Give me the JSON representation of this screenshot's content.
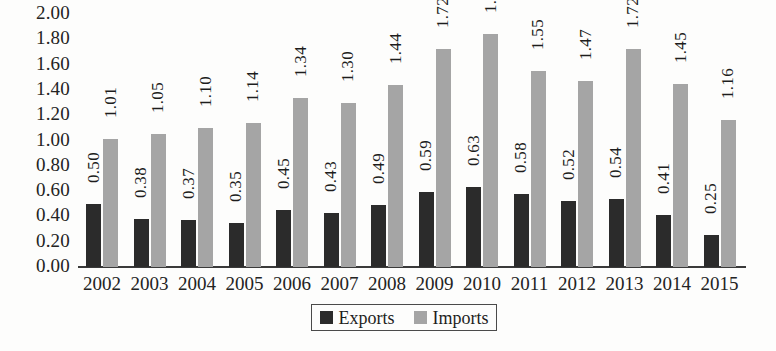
{
  "chart_data": {
    "type": "bar",
    "title": "",
    "subtitle": "",
    "xlabel": "",
    "ylabel": "",
    "categories": [
      "2002",
      "2003",
      "2004",
      "2005",
      "2006",
      "2007",
      "2008",
      "2009",
      "2010",
      "2011",
      "2012",
      "2013",
      "2014",
      "2015"
    ],
    "series": [
      {
        "name": "Exports",
        "color": "#2b2b2b",
        "values": [
          0.5,
          0.38,
          0.37,
          0.35,
          0.45,
          0.43,
          0.49,
          0.59,
          0.63,
          0.58,
          0.52,
          0.54,
          0.41,
          0.25
        ],
        "labels": [
          "0.50",
          "0.38",
          "0.37",
          "0.35",
          "0.45",
          "0.43",
          "0.49",
          "0.59",
          "0.63",
          "0.58",
          "0.52",
          "0.54",
          "0.41",
          "0.25"
        ]
      },
      {
        "name": "Imports",
        "color": "#a5a5a5",
        "values": [
          1.01,
          1.05,
          1.1,
          1.14,
          1.34,
          1.3,
          1.44,
          1.72,
          1.84,
          1.55,
          1.47,
          1.72,
          1.45,
          1.16
        ],
        "labels": [
          "1.01",
          "1.05",
          "1.10",
          "1.14",
          "1.34",
          "1.30",
          "1.44",
          "1.72",
          "1.84",
          "1.55",
          "1.47",
          "1.72",
          "1.45",
          "1.16"
        ]
      }
    ],
    "ylim": [
      0.0,
      2.0
    ],
    "ytick_step": 0.2,
    "ytick_labels": [
      "2.00",
      "1.80",
      "1.60",
      "1.40",
      "1.20",
      "1.00",
      "0.80",
      "0.60",
      "0.40",
      "0.20",
      "0.00"
    ],
    "ytick_values": [
      2.0,
      1.8,
      1.6,
      1.4,
      1.2,
      1.0,
      0.8,
      0.6,
      0.4,
      0.2,
      0.0
    ],
    "grid": false,
    "data_labels": true,
    "data_label_rotation": -90,
    "legend_position": "bottom-center",
    "legend_border": true
  },
  "legend": {
    "items": [
      {
        "label": "Exports",
        "swatch": "exports"
      },
      {
        "label": "Imports",
        "swatch": "imports"
      }
    ]
  }
}
